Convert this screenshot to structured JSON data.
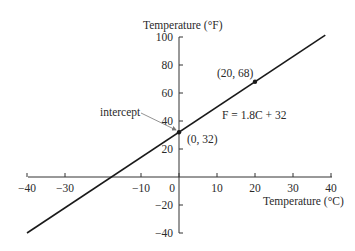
{
  "chart_data": {
    "type": "line",
    "title": "",
    "xlabel": "Temperature (°C)",
    "ylabel": "Temperature (°F)",
    "xlim": [
      -40,
      40
    ],
    "ylim": [
      -40,
      100
    ],
    "grid": false,
    "x_ticks": [
      -40,
      -30,
      -10,
      0,
      10,
      20,
      30,
      40
    ],
    "x_tick_labels": [
      "−40",
      "−30",
      "−10",
      "0",
      "10",
      "20",
      "30",
      "40"
    ],
    "y_ticks": [
      100,
      80,
      60,
      40,
      20,
      -20,
      -40
    ],
    "y_tick_labels": [
      "100",
      "80",
      "60",
      "40",
      "20",
      "−20",
      "−40"
    ],
    "series": [
      {
        "name": "F = 1.8C + 32",
        "x": [
          -40,
          38.5
        ],
        "y": [
          -40,
          101.3
        ]
      }
    ],
    "points": [
      {
        "x": 0,
        "y": 32,
        "label": "(0, 32)"
      },
      {
        "x": 20,
        "y": 68,
        "label": "(20, 68)"
      }
    ],
    "annotations": [
      {
        "text": "intercept",
        "arrow_to": [
          0,
          32
        ]
      },
      {
        "text": "F = 1.8C + 32"
      }
    ]
  },
  "labels": {
    "x_axis_title": "Temperature (°C)",
    "y_axis_title": "Temperature (°F)",
    "equation": "F = 1.8C + 32",
    "intercept": "intercept",
    "point_intercept": "(0, 32)",
    "point_20_68": "(20, 68)"
  },
  "colors": {
    "line": "#1a1a1a",
    "axis": "#333333",
    "arrow": "#777777"
  }
}
